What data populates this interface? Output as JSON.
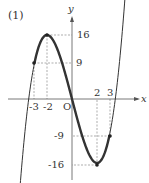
{
  "label": "(1)",
  "chart_data": {
    "type": "line",
    "title": "(1)",
    "function": "y = x^3 - 12x",
    "xlabel": "x",
    "ylabel": "y",
    "origin_label": "O",
    "x_ticks": [
      "-3",
      "-2",
      "2",
      "3"
    ],
    "y_ticks": [
      "16",
      "9",
      "-9",
      "-16"
    ],
    "highlighted_domain": [
      -3,
      3
    ],
    "points": [
      {
        "x": -3,
        "y": 9
      },
      {
        "x": -2,
        "y": 16
      },
      {
        "x": 2,
        "y": -16
      },
      {
        "x": 3,
        "y": -9
      }
    ],
    "xlim": [
      -4.2,
      5.3
    ],
    "ylim": [
      -20,
      20
    ],
    "grid": false
  }
}
